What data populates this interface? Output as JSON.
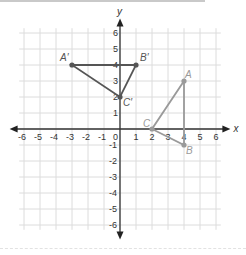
{
  "diagram": {
    "axes": {
      "x_label": "x",
      "y_label": "y",
      "x_range": [
        -6,
        6
      ],
      "y_range": [
        -6,
        6
      ],
      "x_ticks": [
        "-6",
        "-5",
        "-4",
        "-3",
        "-2",
        "-1",
        "0",
        "1",
        "2",
        "3",
        "4",
        "5",
        "6"
      ],
      "y_ticks": [
        "6",
        "5",
        "4",
        "3",
        "2",
        "1",
        "-1",
        "-2",
        "-3",
        "-4",
        "-5",
        "-6"
      ]
    },
    "triangles": [
      {
        "name": "ABC",
        "color": "#9a9a9a",
        "points": [
          {
            "label": "A",
            "x": 4,
            "y": 3
          },
          {
            "label": "B",
            "x": 4,
            "y": -1
          },
          {
            "label": "C",
            "x": 2,
            "y": 0
          }
        ]
      },
      {
        "name": "A'B'C'",
        "color": "#555555",
        "points": [
          {
            "label": "A′",
            "x": -3,
            "y": 4
          },
          {
            "label": "B′",
            "x": 1,
            "y": 4
          },
          {
            "label": "C′",
            "x": 0,
            "y": 2
          }
        ]
      }
    ]
  }
}
